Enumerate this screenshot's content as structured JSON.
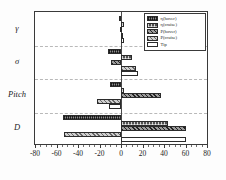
{
  "chart_data": {
    "type": "bar",
    "orientation": "horizontal",
    "title": "",
    "xlabel": "",
    "ylabel": "",
    "categories": [
      "γ",
      "σ",
      "Pitch",
      "D"
    ],
    "xlim": [
      -80,
      80
    ],
    "xticks": [
      -80,
      -60,
      -40,
      -20,
      0,
      20,
      40,
      60,
      80
    ],
    "xtick_labels": [
      "-80",
      "-60",
      "-40",
      "-20",
      "0",
      "20",
      "40",
      "60",
      "80"
    ],
    "grid": true,
    "grid_style": "dashed-horizontal-group-separators",
    "legend_position": "upper-right",
    "series": [
      {
        "name": "η(hover)",
        "pattern": "dense-crosshatch",
        "values": [
          -1.5,
          -12.0,
          -10.0,
          -54.0
        ]
      },
      {
        "name": "η(cruise)",
        "pattern": "checkerboard",
        "values": [
          2.5,
          10.0,
          2.5,
          44.0
        ]
      },
      {
        "name": "P(hover)",
        "pattern": "diagonal-hatch",
        "values": [
          -1.0,
          -9.0,
          37.0,
          60.0
        ]
      },
      {
        "name": "P(cruise)",
        "pattern": "light-diagonal",
        "values": [
          2.0,
          14.0,
          -22.0,
          -53.0
        ]
      },
      {
        "name": "Tip",
        "pattern": "solid-white",
        "values": [
          3.0,
          16.0,
          -11.0,
          60.5
        ]
      }
    ]
  },
  "legend": {
    "items": [
      "η(hover)",
      "η(cruise)",
      "P(hover)",
      "P(cruise)",
      "Tip"
    ]
  }
}
